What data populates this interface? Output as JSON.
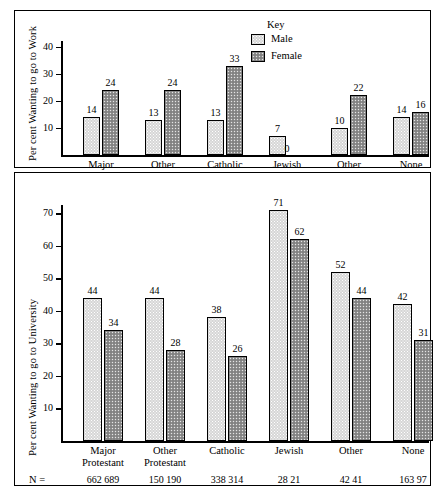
{
  "chart_data": [
    {
      "type": "bar",
      "title": "",
      "ylabel": "Per cent Wanting to go to Work",
      "xlabel": "",
      "ylim": [
        0,
        45
      ],
      "yticks": [
        10,
        20,
        30,
        40
      ],
      "grid": false,
      "legend_position": "top-right",
      "categories": [
        "Major Protestant",
        "Other Protestant",
        "Catholic",
        "Jewish",
        "Other",
        "None"
      ],
      "category_lines": [
        [
          "Major",
          "Protestant"
        ],
        [
          "Other",
          "Protestant"
        ],
        [
          "Catholic",
          ""
        ],
        [
          "Jewish",
          ""
        ],
        [
          "Other",
          ""
        ],
        [
          "None",
          ""
        ]
      ],
      "series": [
        {
          "name": "Male",
          "values": [
            14,
            13,
            13,
            7,
            10,
            14
          ]
        },
        {
          "name": "Female",
          "values": [
            24,
            24,
            33,
            0,
            22,
            16
          ]
        }
      ]
    },
    {
      "type": "bar",
      "title": "",
      "ylabel": "Per cent Wanting to go to University",
      "xlabel": "",
      "ylim": [
        0,
        75
      ],
      "yticks": [
        10,
        20,
        30,
        40,
        50,
        60,
        70
      ],
      "grid": false,
      "legend_position": "none",
      "categories": [
        "Major Protestant",
        "Other Protestant",
        "Catholic",
        "Jewish",
        "Other",
        "None"
      ],
      "category_lines": [
        [
          "Major",
          "Protestant"
        ],
        [
          "Other",
          "Protestant"
        ],
        [
          "Catholic",
          ""
        ],
        [
          "Jewish",
          ""
        ],
        [
          "Other",
          ""
        ],
        [
          "None",
          ""
        ]
      ],
      "series": [
        {
          "name": "Male",
          "values": [
            44,
            44,
            38,
            71,
            52,
            42
          ]
        },
        {
          "name": "Female",
          "values": [
            34,
            28,
            26,
            62,
            44,
            31
          ]
        }
      ],
      "sample_sizes": {
        "row_label": "N =",
        "male": [
          662,
          150,
          338,
          28,
          42,
          163
        ],
        "female": [
          689,
          190,
          314,
          21,
          41,
          97
        ]
      }
    }
  ],
  "legend": {
    "title": "Key",
    "entries": [
      {
        "label": "Male",
        "swatch": "light-stipple"
      },
      {
        "label": "Female",
        "swatch": "dark-stipple"
      }
    ]
  },
  "colors": {
    "male_fill": "#d6d6d6",
    "female_fill": "#8f8f8f",
    "outline": "#000000",
    "background": "#ffffff"
  }
}
